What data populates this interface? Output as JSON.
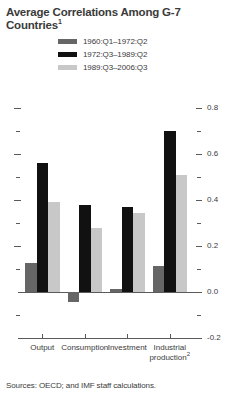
{
  "chart_data": {
    "type": "bar",
    "title": "Average Correlations Among G-7 Countries",
    "title_superscript": "1",
    "xlabel": "",
    "ylabel": "",
    "ylim": [
      -0.2,
      0.8
    ],
    "y_ticks": [
      "0.8",
      "0.6",
      "0.4",
      "0.2",
      "0.0",
      "-0.2"
    ],
    "y_tick_values": [
      0.8,
      0.6,
      0.4,
      0.2,
      0.0,
      -0.2
    ],
    "y_minor_tick_values": [
      0.7,
      0.5,
      0.3,
      0.1,
      -0.1
    ],
    "grid": false,
    "legend_position": "top",
    "axis_side": "right",
    "categories": [
      "Output",
      "Consumption",
      "Investment",
      "Industrial production"
    ],
    "category_superscripts": [
      "",
      "",
      "",
      "2"
    ],
    "series": [
      {
        "name": "1960:Q1–1972:Q2",
        "color": "#666666",
        "values": [
          0.125,
          -0.045,
          0.015,
          0.115
        ]
      },
      {
        "name": "1972:Q3–1989:Q2",
        "color": "#111111",
        "values": [
          0.56,
          0.38,
          0.37,
          0.7
        ]
      },
      {
        "name": "1989:Q3–2006:Q3",
        "color": "#c8c8c8",
        "values": [
          0.39,
          0.28,
          0.345,
          0.51
        ]
      }
    ]
  },
  "footer": {
    "source_note": "Sources: OECD; and IMF staff calculations."
  }
}
